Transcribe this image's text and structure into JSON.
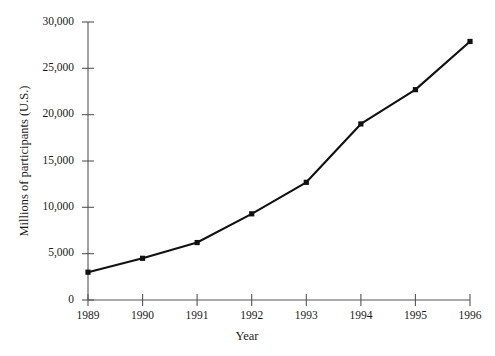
{
  "chart_data": {
    "type": "line",
    "title": "",
    "xlabel": "Year",
    "ylabel": "Millions of participants (U.S.)",
    "categories": [
      "1989",
      "1990",
      "1991",
      "1992",
      "1993",
      "1994",
      "1995",
      "1996"
    ],
    "x": [
      1989,
      1990,
      1991,
      1992,
      1993,
      1994,
      1995,
      1996
    ],
    "values": [
      3000,
      4500,
      6200,
      9300,
      12700,
      19000,
      22700,
      27900
    ],
    "series": [
      {
        "name": "Millions of participants (U.S.)",
        "values": [
          3000,
          4500,
          6200,
          9300,
          12700,
          19000,
          22700,
          27900
        ]
      }
    ],
    "xlim": [
      1989,
      1996
    ],
    "ylim": [
      0,
      30000
    ],
    "ytick_values": [
      0,
      5000,
      10000,
      15000,
      20000,
      25000,
      30000
    ],
    "ytick_labels": [
      "0",
      "5,000",
      "10,000",
      "15,000",
      "20,000",
      "25,000",
      "30,000"
    ],
    "xtick_labels": [
      "1989",
      "1990",
      "1991",
      "1992",
      "1993",
      "1994",
      "1995",
      "1996"
    ],
    "grid": false,
    "legend": false,
    "legend_position": "none",
    "marker": "square",
    "line_color": "#111111",
    "marker_color": "#111111",
    "axis_color": "#555555",
    "background_color": "#ffffff"
  },
  "axes": {
    "y_title": "Millions of participants (U.S.)",
    "x_title": "Year"
  }
}
